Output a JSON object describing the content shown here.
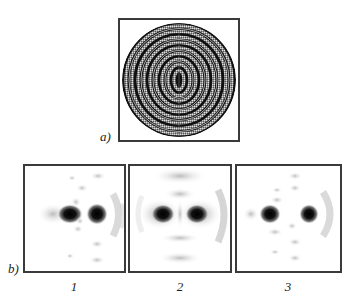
{
  "figure": {
    "panel_a": {
      "label": "a)",
      "description": "concentric ring interference pattern",
      "ring_count": 9
    },
    "panel_b": {
      "label": "b)",
      "subpanels": [
        {
          "label": "1",
          "description": "two-spot intensity distribution, sparse side lobes"
        },
        {
          "label": "2",
          "description": "two-spot intensity distribution, broader arcs"
        },
        {
          "label": "3",
          "description": "two-spot intensity distribution, cross pattern"
        }
      ]
    }
  }
}
